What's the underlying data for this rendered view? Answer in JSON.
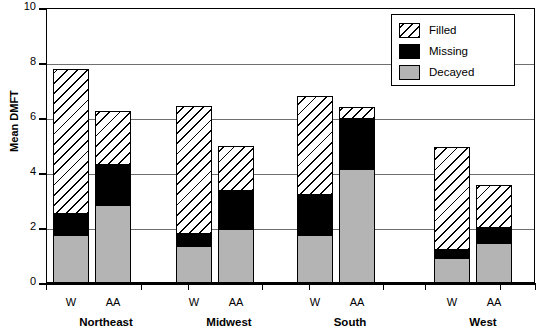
{
  "chart_data": {
    "type": "bar",
    "subtype": "stacked-grouped",
    "title": "",
    "xlabel": "",
    "ylabel": "Mean DMFT",
    "ylim": [
      0,
      10
    ],
    "yticks": [
      0,
      2,
      4,
      6,
      8,
      10
    ],
    "ytick_labels": [
      "0",
      "2",
      "4",
      "6",
      "8",
      "10"
    ],
    "grid": "horizontal",
    "legend_position": "top-right",
    "groups": [
      "Northeast",
      "Midwest",
      "South",
      "West"
    ],
    "categories": [
      "W",
      "AA",
      "W",
      "AA",
      "W",
      "AA",
      "W",
      "AA"
    ],
    "series": [
      {
        "name": "Decayed",
        "color": "#b4b4b4",
        "pattern": "solid-gray",
        "values": [
          1.75,
          2.85,
          1.35,
          1.95,
          1.75,
          4.15,
          0.9,
          1.45
        ]
      },
      {
        "name": "Missing",
        "color": "#000000",
        "pattern": "solid-black",
        "values": [
          0.75,
          1.45,
          0.45,
          1.4,
          1.45,
          1.8,
          0.3,
          0.55
        ]
      },
      {
        "name": "Filled",
        "color": "#ffffff",
        "pattern": "diagonal-hatch",
        "values": [
          5.3,
          1.95,
          4.65,
          1.65,
          3.6,
          0.45,
          3.75,
          1.55
        ]
      }
    ],
    "totals": [
      7.8,
      6.25,
      6.45,
      5.0,
      6.8,
      6.4,
      4.95,
      3.55
    ],
    "bars": [
      {
        "group": "Northeast",
        "race": "W",
        "decayed": 1.75,
        "missing": 0.75,
        "filled": 5.3,
        "total": 7.8
      },
      {
        "group": "Northeast",
        "race": "AA",
        "decayed": 2.85,
        "missing": 1.45,
        "filled": 1.95,
        "total": 6.25
      },
      {
        "group": "Midwest",
        "race": "W",
        "decayed": 1.35,
        "missing": 0.45,
        "filled": 4.65,
        "total": 6.45
      },
      {
        "group": "Midwest",
        "race": "AA",
        "decayed": 1.95,
        "missing": 1.4,
        "filled": 1.65,
        "total": 5.0
      },
      {
        "group": "South",
        "race": "W",
        "decayed": 1.75,
        "missing": 1.45,
        "filled": 3.6,
        "total": 6.8
      },
      {
        "group": "South",
        "race": "AA",
        "decayed": 4.15,
        "missing": 1.8,
        "filled": 0.45,
        "total": 6.4
      },
      {
        "group": "West",
        "race": "W",
        "decayed": 0.9,
        "missing": 0.3,
        "filled": 3.75,
        "total": 4.95
      },
      {
        "group": "West",
        "race": "AA",
        "decayed": 1.45,
        "missing": 0.55,
        "filled": 1.55,
        "total": 3.55
      }
    ]
  },
  "axis": {
    "y_title": "Mean DMFT",
    "y_tick_labels": [
      "10",
      "8",
      "6",
      "4",
      "2",
      "0"
    ]
  },
  "legend": {
    "items": [
      {
        "label": "Filled",
        "style": "diagonal-hatch"
      },
      {
        "label": "Missing",
        "style": "solid-black"
      },
      {
        "label": "Decayed",
        "style": "solid-gray"
      }
    ]
  },
  "x_axis": {
    "bar_labels": [
      "W",
      "AA",
      "W",
      "AA",
      "W",
      "AA",
      "W",
      "AA"
    ],
    "group_labels": [
      "Northeast",
      "Midwest",
      "South",
      "West"
    ]
  }
}
